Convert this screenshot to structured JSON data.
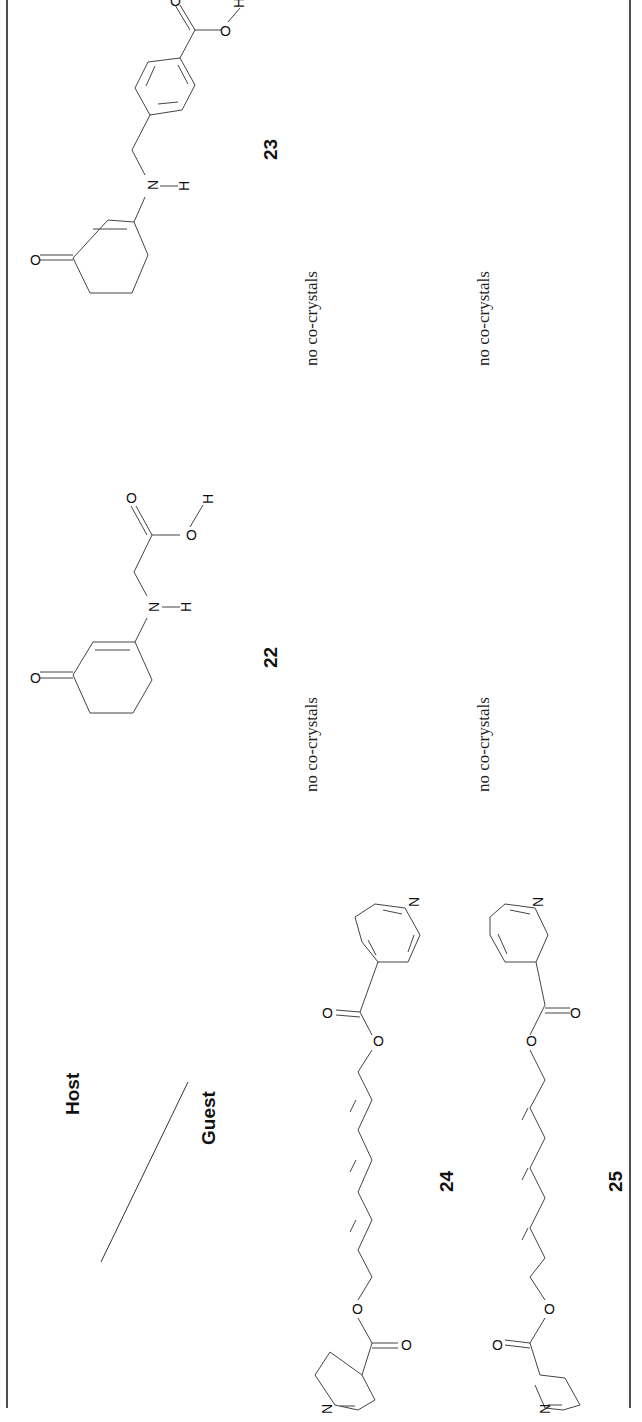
{
  "table": {
    "header": {
      "host_label": "Host",
      "guest_label": "Guest"
    },
    "hosts": [
      {
        "id": "22",
        "label": "22",
        "description": "3-oxocyclohexenyl-amino acetic acid"
      },
      {
        "id": "23",
        "label": "23",
        "description": "4-[(3-oxocyclohexenylamino)methyl]benzoic acid"
      }
    ],
    "guests": [
      {
        "id": "24",
        "label": "24",
        "description": "octatriene-diyl bis(isonicotinate)"
      },
      {
        "id": "25",
        "label": "25",
        "description": "octatriene-diyl bis(nicotinate)"
      }
    ],
    "cells": [
      {
        "host": "22",
        "guest": "24",
        "result": "no co-crystals"
      },
      {
        "host": "22",
        "guest": "25",
        "result": "no co-crystals"
      },
      {
        "host": "23",
        "guest": "24",
        "result": "no co-crystals"
      },
      {
        "host": "23",
        "guest": "25",
        "result": "no co-crystals"
      }
    ],
    "atom_labels": {
      "oxygen": "O",
      "nitrogen": "N",
      "hydrogen": "H"
    }
  }
}
